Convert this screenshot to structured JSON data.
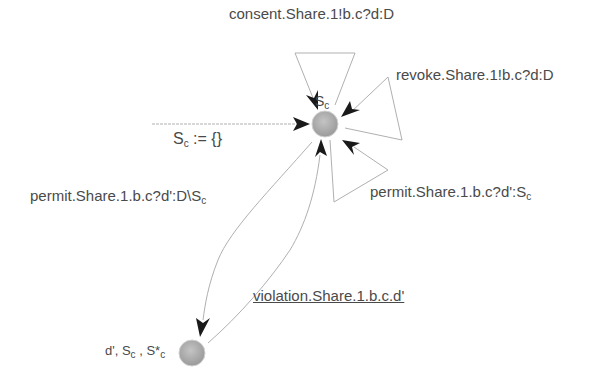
{
  "diagram": {
    "type": "state-transition",
    "nodes": [
      {
        "id": "main",
        "label_main": "S",
        "label_sub": "c"
      },
      {
        "id": "violation",
        "label_d": "d', ",
        "label_s": "S",
        "label_s_sub": "c",
        "label_sep": " , ",
        "label_star": "S*",
        "label_star_sub": "c"
      }
    ],
    "edges": {
      "init": {
        "label_main": "S",
        "label_sub": "c",
        "label_rest": " := {}"
      },
      "consent": {
        "label": "consent.Share.1!b.c?d:D"
      },
      "revoke": {
        "label": "revoke.Share.1!b.c?d:D"
      },
      "permit_self": {
        "label_main": "permit.Share.1.b.c?d':S",
        "label_sub": "c"
      },
      "permit_out": {
        "label_main": "permit.Share.1.b.c?d':D\\S",
        "label_sub": "c"
      },
      "violation": {
        "label": "violation.Share.1.b.c.d'"
      }
    },
    "colors": {
      "line": "#b0b0b0",
      "arrow": "#1a1a1a",
      "node_fill": "#a8a8a8",
      "text": "#4a4a4a"
    }
  }
}
